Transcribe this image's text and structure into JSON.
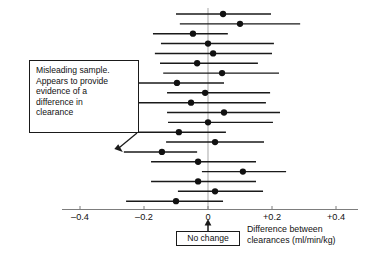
{
  "figure": {
    "title": "",
    "annotation": {
      "text": "Misleading sample.\nAppears to provide\nevidence of a\ndifference in\nclearance",
      "points_to_row": 14
    },
    "no_change_label": "No change",
    "axis_caption": "Difference between\nclearances (ml/min/kg)"
  },
  "chart_data": {
    "type": "scatter",
    "title": "",
    "xlabel": "Difference between clearances (ml/min/kg)",
    "ylabel": "",
    "xlim": [
      -0.45,
      0.45
    ],
    "xticks": [
      -0.4,
      -0.2,
      0,
      0.2,
      0.4
    ],
    "xticklabels": [
      "–0.4",
      "–0.2",
      "0",
      "+0.2",
      "+0.4"
    ],
    "grid": false,
    "legend": null,
    "reference_line": 0,
    "reference_line_label": "No change",
    "categories": [
      "1",
      "2",
      "3",
      "4",
      "5",
      "6",
      "7",
      "8",
      "9",
      "10",
      "11",
      "12",
      "13",
      "14",
      "15",
      "16",
      "17",
      "18",
      "19"
    ],
    "series": [
      {
        "name": "Difference between clearances",
        "points": [
          {
            "row": 1,
            "estimate": 0.047,
            "low": -0.1,
            "high": 0.197
          },
          {
            "row": 2,
            "estimate": 0.1,
            "low": -0.088,
            "high": 0.288
          },
          {
            "row": 3,
            "estimate": -0.047,
            "low": -0.172,
            "high": 0.062
          },
          {
            "row": 4,
            "estimate": 0.0,
            "low": -0.147,
            "high": 0.206
          },
          {
            "row": 5,
            "estimate": 0.016,
            "low": -0.166,
            "high": 0.2
          },
          {
            "row": 6,
            "estimate": -0.034,
            "low": -0.15,
            "high": 0.156
          },
          {
            "row": 7,
            "estimate": 0.044,
            "low": -0.14,
            "high": 0.222
          },
          {
            "row": 8,
            "estimate": -0.097,
            "low": -0.244,
            "high": 0.05
          },
          {
            "row": 9,
            "estimate": -0.009,
            "low": -0.128,
            "high": 0.194
          },
          {
            "row": 10,
            "estimate": -0.053,
            "low": -0.241,
            "high": 0.181
          },
          {
            "row": 11,
            "estimate": 0.05,
            "low": -0.128,
            "high": 0.225
          },
          {
            "row": 12,
            "estimate": 0.0,
            "low": -0.125,
            "high": 0.203
          },
          {
            "row": 13,
            "estimate": -0.091,
            "low": -0.241,
            "high": 0.056
          },
          {
            "row": 14,
            "estimate": 0.022,
            "low": -0.131,
            "high": 0.175
          },
          {
            "row": 15,
            "estimate": -0.144,
            "low": -0.263,
            "high": -0.034
          },
          {
            "row": 16,
            "estimate": -0.031,
            "low": -0.178,
            "high": 0.15
          },
          {
            "row": 17,
            "estimate": 0.109,
            "low": -0.019,
            "high": 0.244
          },
          {
            "row": 18,
            "estimate": -0.031,
            "low": -0.178,
            "high": 0.15
          },
          {
            "row": 19,
            "estimate": 0.022,
            "low": -0.094,
            "high": 0.172
          },
          {
            "row": 20,
            "estimate": -0.1,
            "low": -0.256,
            "high": 0.047
          }
        ]
      }
    ],
    "annotations": [
      {
        "text": "Misleading sample. Appears to provide evidence of a difference in clearance",
        "target_row": 15
      }
    ]
  },
  "style": {
    "line_color": "#1a1a1a",
    "dot_color": "#111111",
    "axis_color": "#7d7d7d",
    "zero_line_color": "#b0b0b0",
    "background": "#ffffff"
  }
}
